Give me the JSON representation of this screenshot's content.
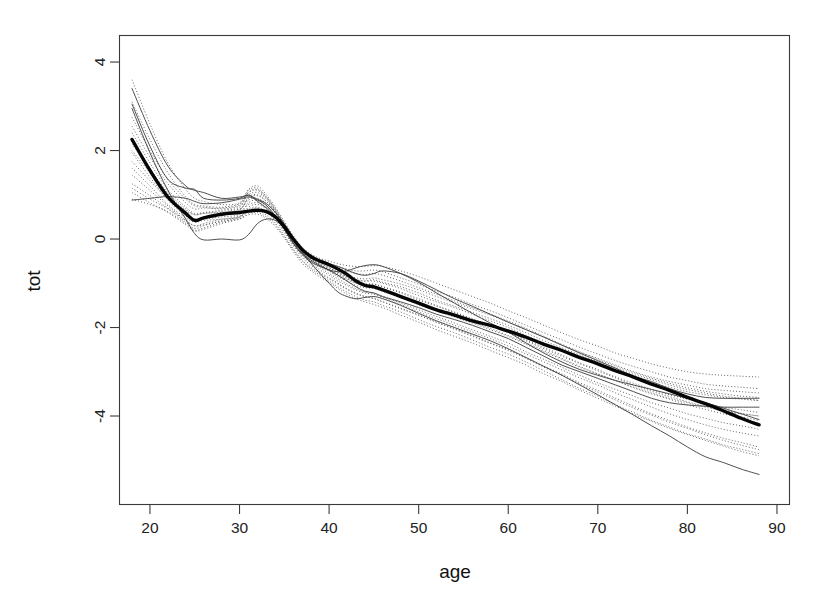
{
  "chart_data": {
    "type": "line",
    "title": "",
    "subtitle": "",
    "xlabel": "age",
    "ylabel": "tot",
    "xlim": [
      16.6,
      91.4
    ],
    "ylim": [
      -6.0,
      4.6
    ],
    "xticks": [
      20,
      30,
      40,
      50,
      60,
      70,
      80,
      90
    ],
    "xtick_labels": [
      "20",
      "30",
      "40",
      "50",
      "60",
      "70",
      "80",
      "90"
    ],
    "yticks": [
      4,
      2,
      0,
      -2,
      -4
    ],
    "ytick_labels": [
      "4",
      "2",
      "0",
      "-2",
      "-4"
    ],
    "grid": false,
    "legend": null,
    "legend_position": "none",
    "box": true,
    "annotations": [],
    "x_common": [
      18,
      20,
      22,
      24,
      25,
      26,
      28,
      30,
      31,
      32,
      33,
      34,
      35,
      36,
      37,
      38,
      39,
      40,
      41,
      42,
      43,
      44,
      45,
      46,
      48,
      50,
      52,
      54,
      56,
      58,
      60,
      62,
      64,
      66,
      68,
      70,
      72,
      74,
      76,
      78,
      80,
      82,
      84,
      86,
      88
    ],
    "series": [
      {
        "name": "population-mean-curve",
        "style": "thick-solid",
        "values": [
          2.25,
          1.55,
          0.95,
          0.58,
          0.42,
          0.48,
          0.56,
          0.6,
          0.63,
          0.65,
          0.62,
          0.5,
          0.28,
          0.0,
          -0.24,
          -0.4,
          -0.5,
          -0.58,
          -0.68,
          -0.8,
          -0.95,
          -1.05,
          -1.08,
          -1.15,
          -1.3,
          -1.45,
          -1.6,
          -1.72,
          -1.85,
          -1.95,
          -2.08,
          -2.22,
          -2.38,
          -2.52,
          -2.68,
          -2.82,
          -2.98,
          -3.12,
          -3.28,
          -3.42,
          -3.58,
          -3.72,
          -3.88,
          -4.05,
          -4.2
        ]
      },
      {
        "name": "individual-curve-1",
        "style": "thin-solid",
        "values": [
          3.4,
          2.45,
          1.65,
          1.2,
          1.1,
          1.05,
          0.92,
          0.95,
          0.98,
          0.9,
          0.8,
          0.6,
          0.35,
          0.02,
          -0.25,
          -0.42,
          -0.5,
          -0.56,
          -0.62,
          -0.7,
          -0.78,
          -0.82,
          -0.78,
          -0.72,
          -0.78,
          -0.95,
          -1.15,
          -1.35,
          -1.52,
          -1.7,
          -1.88,
          -2.05,
          -2.22,
          -2.4,
          -2.58,
          -2.75,
          -2.92,
          -3.1,
          -3.22,
          -3.38,
          -3.5,
          -3.58,
          -3.6,
          -3.6,
          -3.6
        ]
      },
      {
        "name": "individual-curve-2",
        "style": "thin-solid",
        "values": [
          3.05,
          2.1,
          1.35,
          1.15,
          1.12,
          0.92,
          0.88,
          0.92,
          1.0,
          0.85,
          0.7,
          0.5,
          0.22,
          -0.08,
          -0.32,
          -0.48,
          -0.6,
          -0.7,
          -0.82,
          -0.95,
          -1.08,
          -1.18,
          -1.22,
          -1.3,
          -1.42,
          -1.55,
          -1.7,
          -1.82,
          -1.95,
          -2.1,
          -2.25,
          -2.45,
          -2.65,
          -2.85,
          -3.0,
          -3.15,
          -3.3,
          -3.45,
          -3.6,
          -3.7,
          -3.75,
          -3.78,
          -3.8,
          -3.8,
          -3.8
        ]
      },
      {
        "name": "individual-curve-3",
        "style": "thin-solid",
        "values": [
          0.88,
          0.92,
          0.96,
          0.92,
          0.85,
          0.8,
          0.82,
          0.9,
          0.95,
          0.88,
          0.76,
          0.52,
          0.22,
          -0.1,
          -0.35,
          -0.52,
          -0.62,
          -0.7,
          -0.74,
          -0.72,
          -0.65,
          -0.6,
          -0.58,
          -0.62,
          -0.78,
          -0.98,
          -1.22,
          -1.45,
          -1.68,
          -1.9,
          -2.1,
          -2.35,
          -2.58,
          -2.78,
          -2.95,
          -3.08,
          -3.2,
          -3.3,
          -3.4,
          -3.5,
          -3.6,
          -3.7,
          -3.82,
          -3.95,
          -4.08
        ]
      },
      {
        "name": "individual-curve-4",
        "style": "thin-solid",
        "values": [
          2.95,
          1.95,
          1.1,
          0.45,
          0.12,
          -0.02,
          0.0,
          -0.02,
          0.1,
          0.35,
          0.45,
          0.42,
          0.25,
          -0.02,
          -0.3,
          -0.55,
          -0.78,
          -1.0,
          -1.2,
          -1.3,
          -1.35,
          -1.32,
          -1.3,
          -1.35,
          -1.5,
          -1.68,
          -1.85,
          -2.0,
          -2.15,
          -2.3,
          -2.48,
          -2.68,
          -2.88,
          -3.08,
          -3.3,
          -3.52,
          -3.75,
          -3.98,
          -4.22,
          -4.45,
          -4.7,
          -4.92,
          -5.05,
          -5.2,
          -5.32
        ]
      },
      {
        "name": "bootstrap-curve-1",
        "style": "dotted",
        "values": [
          3.6,
          2.6,
          1.72,
          1.12,
          0.92,
          0.85,
          0.78,
          0.82,
          1.12,
          1.2,
          1.0,
          0.72,
          0.4,
          0.08,
          -0.18,
          -0.34,
          -0.44,
          -0.5,
          -0.56,
          -0.6,
          -0.62,
          -0.62,
          -0.6,
          -0.62,
          -0.72,
          -0.85,
          -1.0,
          -1.15,
          -1.3,
          -1.45,
          -1.62,
          -1.78,
          -1.95,
          -2.12,
          -2.28,
          -2.42,
          -2.58,
          -2.7,
          -2.82,
          -2.92,
          -3.0,
          -3.05,
          -3.08,
          -3.1,
          -3.12
        ]
      },
      {
        "name": "bootstrap-curve-2",
        "style": "dotted",
        "values": [
          2.55,
          1.85,
          1.25,
          0.82,
          0.68,
          0.7,
          0.7,
          0.78,
          1.1,
          1.15,
          0.95,
          0.68,
          0.35,
          0.02,
          -0.22,
          -0.38,
          -0.48,
          -0.55,
          -0.62,
          -0.68,
          -0.72,
          -0.72,
          -0.7,
          -0.74,
          -0.88,
          -1.02,
          -1.18,
          -1.32,
          -1.48,
          -1.62,
          -1.78,
          -1.95,
          -2.12,
          -2.28,
          -2.45,
          -2.6,
          -2.75,
          -2.88,
          -3.0,
          -3.12,
          -3.2,
          -3.28,
          -3.32,
          -3.35,
          -3.38
        ]
      },
      {
        "name": "bootstrap-curve-3",
        "style": "dotted",
        "values": [
          2.25,
          1.6,
          1.02,
          0.6,
          0.45,
          0.5,
          0.58,
          0.65,
          0.95,
          1.0,
          0.85,
          0.6,
          0.3,
          0.0,
          -0.25,
          -0.42,
          -0.55,
          -0.65,
          -0.75,
          -0.85,
          -0.92,
          -0.95,
          -0.95,
          -1.0,
          -1.12,
          -1.28,
          -1.42,
          -1.55,
          -1.7,
          -1.85,
          -2.0,
          -2.18,
          -2.35,
          -2.52,
          -2.68,
          -2.82,
          -2.98,
          -3.12,
          -3.25,
          -3.35,
          -3.45,
          -3.52,
          -3.58,
          -3.62,
          -3.65
        ]
      },
      {
        "name": "bootstrap-curve-4",
        "style": "dotted",
        "values": [
          1.95,
          1.4,
          0.88,
          0.52,
          0.4,
          0.45,
          0.5,
          0.56,
          0.82,
          0.88,
          0.75,
          0.52,
          0.25,
          -0.05,
          -0.3,
          -0.48,
          -0.6,
          -0.72,
          -0.85,
          -0.95,
          -1.05,
          -1.1,
          -1.12,
          -1.18,
          -1.32,
          -1.48,
          -1.62,
          -1.76,
          -1.9,
          -2.05,
          -2.2,
          -2.38,
          -2.55,
          -2.72,
          -2.9,
          -3.05,
          -3.2,
          -3.35,
          -3.48,
          -3.6,
          -3.7,
          -3.8,
          -3.88,
          -3.95,
          -4.0
        ]
      },
      {
        "name": "bootstrap-curve-5",
        "style": "dotted",
        "values": [
          1.6,
          1.2,
          0.78,
          0.48,
          0.38,
          0.42,
          0.45,
          0.5,
          0.72,
          0.78,
          0.68,
          0.48,
          0.2,
          -0.1,
          -0.35,
          -0.52,
          -0.65,
          -0.78,
          -0.9,
          -1.02,
          -1.12,
          -1.2,
          -1.22,
          -1.3,
          -1.45,
          -1.6,
          -1.75,
          -1.9,
          -2.05,
          -2.2,
          -2.35,
          -2.55,
          -2.72,
          -2.9,
          -3.08,
          -3.25,
          -3.4,
          -3.55,
          -3.7,
          -3.82,
          -3.95,
          -4.05,
          -4.15,
          -4.22,
          -4.3
        ]
      },
      {
        "name": "bootstrap-curve-6",
        "style": "dotted",
        "values": [
          1.25,
          0.98,
          0.7,
          0.42,
          0.3,
          0.32,
          0.4,
          0.48,
          0.65,
          0.7,
          0.6,
          0.42,
          0.15,
          -0.15,
          -0.42,
          -0.6,
          -0.75,
          -0.88,
          -1.0,
          -1.12,
          -1.22,
          -1.3,
          -1.35,
          -1.42,
          -1.58,
          -1.72,
          -1.88,
          -2.02,
          -2.18,
          -2.35,
          -2.5,
          -2.68,
          -2.88,
          -3.05,
          -3.25,
          -3.42,
          -3.6,
          -3.78,
          -3.95,
          -4.1,
          -4.25,
          -4.38,
          -4.5,
          -4.6,
          -4.7
        ]
      },
      {
        "name": "bootstrap-curve-7",
        "style": "dotted",
        "values": [
          1.05,
          0.82,
          0.6,
          0.32,
          0.18,
          0.22,
          0.35,
          0.45,
          0.58,
          0.6,
          0.5,
          0.32,
          0.05,
          -0.25,
          -0.5,
          -0.68,
          -0.82,
          -0.95,
          -1.08,
          -1.2,
          -1.3,
          -1.38,
          -1.42,
          -1.5,
          -1.65,
          -1.82,
          -1.98,
          -2.12,
          -2.28,
          -2.45,
          -2.6,
          -2.78,
          -2.98,
          -3.18,
          -3.38,
          -3.55,
          -3.75,
          -3.92,
          -4.1,
          -4.25,
          -4.4,
          -4.52,
          -4.65,
          -4.75,
          -4.85
        ]
      },
      {
        "name": "bootstrap-curve-8",
        "style": "dotted",
        "values": [
          3.1,
          2.25,
          1.5,
          0.95,
          0.78,
          0.75,
          0.72,
          0.8,
          1.05,
          1.1,
          0.92,
          0.65,
          0.32,
          0.0,
          -0.24,
          -0.4,
          -0.5,
          -0.58,
          -0.65,
          -0.72,
          -0.78,
          -0.8,
          -0.78,
          -0.82,
          -0.95,
          -1.1,
          -1.25,
          -1.4,
          -1.55,
          -1.7,
          -1.85,
          -2.02,
          -2.2,
          -2.38,
          -2.55,
          -2.7,
          -2.85,
          -3.0,
          -3.12,
          -3.22,
          -3.3,
          -3.38,
          -3.42,
          -3.45,
          -3.48
        ]
      },
      {
        "name": "bootstrap-curve-9",
        "style": "dotted",
        "values": [
          2.75,
          2.0,
          1.35,
          0.9,
          0.75,
          0.72,
          0.68,
          0.75,
          1.0,
          1.05,
          0.9,
          0.62,
          0.3,
          -0.02,
          -0.26,
          -0.44,
          -0.55,
          -0.65,
          -0.75,
          -0.85,
          -0.92,
          -0.95,
          -0.92,
          -0.98,
          -1.08,
          -1.22,
          -1.38,
          -1.52,
          -1.66,
          -1.8,
          -1.95,
          -2.12,
          -2.3,
          -2.46,
          -2.62,
          -2.78,
          -2.92,
          -3.06,
          -3.18,
          -3.3,
          -3.4,
          -3.48,
          -3.55,
          -3.6,
          -3.65
        ]
      },
      {
        "name": "bootstrap-curve-10",
        "style": "dotted",
        "values": [
          2.0,
          1.5,
          1.0,
          0.65,
          0.55,
          0.58,
          0.62,
          0.68,
          0.88,
          0.92,
          0.8,
          0.58,
          0.28,
          -0.02,
          -0.28,
          -0.45,
          -0.58,
          -0.68,
          -0.78,
          -0.88,
          -0.98,
          -1.02,
          -1.02,
          -1.08,
          -1.2,
          -1.35,
          -1.5,
          -1.65,
          -1.8,
          -1.95,
          -2.1,
          -2.28,
          -2.45,
          -2.62,
          -2.8,
          -2.95,
          -3.12,
          -3.26,
          -3.4,
          -3.52,
          -3.62,
          -3.72,
          -3.8,
          -3.86,
          -3.92
        ]
      },
      {
        "name": "bootstrap-curve-11",
        "style": "dotted",
        "values": [
          1.45,
          1.1,
          0.75,
          0.42,
          0.3,
          0.35,
          0.45,
          0.52,
          0.68,
          0.72,
          0.62,
          0.45,
          0.18,
          -0.12,
          -0.38,
          -0.55,
          -0.7,
          -0.82,
          -0.95,
          -1.05,
          -1.15,
          -1.22,
          -1.25,
          -1.32,
          -1.48,
          -1.65,
          -1.8,
          -1.95,
          -2.1,
          -2.25,
          -2.42,
          -2.6,
          -2.78,
          -2.96,
          -3.14,
          -3.3,
          -3.48,
          -3.64,
          -3.8,
          -3.95,
          -4.08,
          -4.2,
          -4.3,
          -4.38,
          -4.45
        ]
      },
      {
        "name": "bootstrap-curve-12",
        "style": "dotted",
        "values": [
          1.75,
          1.32,
          0.9,
          0.55,
          0.45,
          0.48,
          0.55,
          0.62,
          0.78,
          0.82,
          0.72,
          0.52,
          0.22,
          -0.08,
          -0.32,
          -0.5,
          -0.62,
          -0.72,
          -0.82,
          -0.92,
          -1.0,
          -1.05,
          -1.08,
          -1.15,
          -1.28,
          -1.42,
          -1.58,
          -1.72,
          -1.88,
          -2.02,
          -2.18,
          -2.35,
          -2.52,
          -2.7,
          -2.88,
          -3.05,
          -3.2,
          -3.36,
          -3.5,
          -3.62,
          -3.75,
          -3.85,
          -3.95,
          -4.02,
          -4.1
        ]
      },
      {
        "name": "bootstrap-curve-13",
        "style": "dotted",
        "values": [
          0.9,
          0.78,
          0.62,
          0.35,
          0.2,
          0.25,
          0.38,
          0.46,
          0.55,
          0.56,
          0.46,
          0.28,
          0.02,
          -0.28,
          -0.55,
          -0.72,
          -0.86,
          -0.98,
          -1.12,
          -1.25,
          -1.35,
          -1.42,
          -1.48,
          -1.55,
          -1.72,
          -1.88,
          -2.05,
          -2.2,
          -2.35,
          -2.52,
          -2.68,
          -2.85,
          -3.05,
          -3.22,
          -3.42,
          -3.6,
          -3.78,
          -3.96,
          -4.12,
          -4.28,
          -4.42,
          -4.55,
          -4.68,
          -4.8,
          -4.9
        ]
      },
      {
        "name": "bootstrap-curve-14",
        "style": "dotted",
        "values": [
          2.4,
          1.72,
          1.12,
          0.72,
          0.58,
          0.6,
          0.65,
          0.72,
          1.05,
          1.12,
          0.95,
          0.68,
          0.34,
          0.02,
          -0.22,
          -0.38,
          -0.5,
          -0.6,
          -0.7,
          -0.8,
          -0.88,
          -0.9,
          -0.88,
          -0.92,
          -1.02,
          -1.15,
          -1.3,
          -1.44,
          -1.58,
          -1.72,
          -1.88,
          -2.05,
          -2.22,
          -2.4,
          -2.56,
          -2.72,
          -2.88,
          -3.02,
          -3.15,
          -3.26,
          -3.36,
          -3.44,
          -3.5,
          -3.55,
          -3.58
        ]
      },
      {
        "name": "bootstrap-curve-15",
        "style": "dotted",
        "values": [
          2.15,
          1.58,
          1.05,
          0.68,
          0.55,
          0.58,
          0.6,
          0.66,
          0.92,
          0.98,
          0.85,
          0.62,
          0.3,
          -0.02,
          -0.28,
          -0.45,
          -0.58,
          -0.7,
          -0.8,
          -0.9,
          -0.98,
          -1.02,
          -1.02,
          -1.08,
          -1.22,
          -1.38,
          -1.52,
          -1.66,
          -1.82,
          -1.96,
          -2.12,
          -2.3,
          -2.48,
          -2.65,
          -2.82,
          -2.98,
          -3.14,
          -3.3,
          -3.44,
          -3.56,
          -3.68,
          -3.78,
          -3.86,
          -3.94,
          -4.0
        ]
      },
      {
        "name": "bootstrap-curve-16",
        "style": "dotted",
        "values": [
          1.15,
          0.9,
          0.68,
          0.38,
          0.24,
          0.3,
          0.42,
          0.5,
          0.62,
          0.64,
          0.54,
          0.36,
          0.08,
          -0.22,
          -0.48,
          -0.65,
          -0.78,
          -0.9,
          -1.02,
          -1.14,
          -1.24,
          -1.3,
          -1.34,
          -1.42,
          -1.56,
          -1.72,
          -1.88,
          -2.04,
          -2.2,
          -2.36,
          -2.52,
          -2.7,
          -2.9,
          -3.08,
          -3.28,
          -3.46,
          -3.64,
          -3.82,
          -3.98,
          -4.14,
          -4.28,
          -4.42,
          -4.55,
          -4.66,
          -4.76
        ]
      }
    ]
  },
  "figure": {
    "background_color": "#ffffff",
    "foreground_color": "#111111",
    "mean_curve_color": "#050505",
    "individual_curve_color": "#3b3b3b",
    "bootstrap_curve_color": "#4a4a4a"
  }
}
